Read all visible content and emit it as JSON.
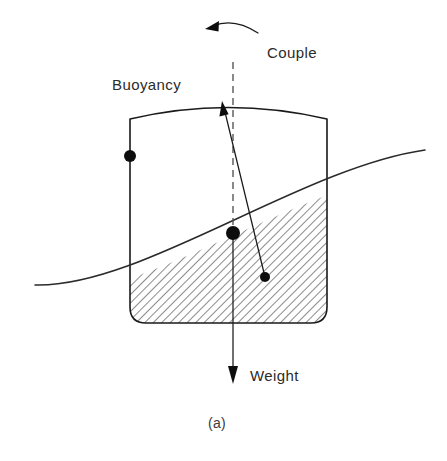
{
  "figure": {
    "caption": "(a)",
    "width": 447,
    "height": 461,
    "background_color": "#ffffff",
    "line_color": "#1a1a1a",
    "labels": {
      "buoyancy": "Buoyancy",
      "couple": "Couple",
      "weight": "Weight"
    },
    "label_positions": {
      "buoyancy": {
        "x": 112,
        "y": 90
      },
      "couple": {
        "x": 267,
        "y": 58
      },
      "weight": {
        "x": 250,
        "y": 381
      },
      "caption": {
        "x": 208,
        "y": 428
      }
    },
    "hull": {
      "name": "floating-body",
      "left_wall_x": 130,
      "right_wall_x": 327,
      "bottom_y": 323,
      "deck_left_y": 119,
      "deck_right_y": 119,
      "deck_peak_x": 228,
      "deck_peak_y": 104,
      "corner_radius": 16
    },
    "waterline": {
      "name": "water-surface",
      "start": {
        "x": 35,
        "y": 285
      },
      "end": {
        "x": 425,
        "y": 150
      },
      "control_1": {
        "x": 140,
        "y": 288
      },
      "control_2": {
        "x": 300,
        "y": 168
      }
    },
    "hatching": {
      "angle_degrees": 45,
      "spacing_px": 6,
      "color": "#333333"
    },
    "markers": [
      {
        "name": "left-wall-point",
        "x": 130,
        "y": 156,
        "radius": 6
      },
      {
        "name": "center-of-gravity",
        "x": 233,
        "y": 233,
        "radius": 7
      },
      {
        "name": "center-of-buoyancy",
        "x": 265,
        "y": 277,
        "radius": 5
      }
    ],
    "vectors": {
      "buoyancy_arrow": {
        "from": {
          "x": 265,
          "y": 277
        },
        "to": {
          "x": 222,
          "y": 103
        }
      },
      "weight_arrow": {
        "from": {
          "x": 233,
          "y": 233
        },
        "to": {
          "x": 233,
          "y": 383
        }
      },
      "centerline_dashed": {
        "from": {
          "x": 233,
          "y": 62
        },
        "to": {
          "x": 233,
          "y": 236
        }
      }
    },
    "couple_arc": {
      "name": "couple-rotation-arrow",
      "start": {
        "x": 257,
        "y": 32
      },
      "end": {
        "x": 208,
        "y": 26
      },
      "control": {
        "x": 232,
        "y": 19
      },
      "direction": "counterclockwise"
    }
  }
}
